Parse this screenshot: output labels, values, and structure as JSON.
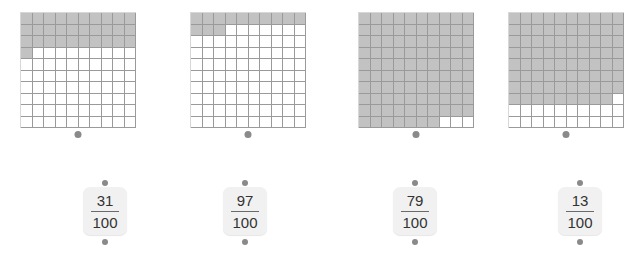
{
  "exercise": {
    "type": "hundredths-grid-to-fraction-matching",
    "denominator_label": "100"
  },
  "grids": [
    {
      "name": "grid-1",
      "shaded_count": 31,
      "total_cells": 100,
      "left": 20,
      "dot_label": "connector-dot"
    },
    {
      "name": "grid-2",
      "shaded_count": 13,
      "total_cells": 100,
      "left": 190,
      "dot_label": "connector-dot"
    },
    {
      "name": "grid-3",
      "shaded_count": 97,
      "total_cells": 100,
      "left": 358,
      "dot_label": "connector-dot"
    },
    {
      "name": "grid-4",
      "shaded_count": 79,
      "total_cells": 100,
      "left": 508,
      "dot_label": "connector-dot"
    }
  ],
  "cards": [
    {
      "name": "card-1",
      "numerator": "31",
      "denominator": "100",
      "left": 76
    },
    {
      "name": "card-2",
      "numerator": "97",
      "denominator": "100",
      "left": 216
    },
    {
      "name": "card-3",
      "numerator": "79",
      "denominator": "100",
      "left": 386
    },
    {
      "name": "card-4",
      "numerator": "13",
      "denominator": "100",
      "left": 551
    }
  ],
  "colors": {
    "shaded_cell": "#c2c2c2",
    "cell_border": "#9a9a9a",
    "card_background": "#f1f1f1",
    "dot": "#8a8a8a",
    "text": "#333333",
    "page_background": "#ffffff"
  }
}
